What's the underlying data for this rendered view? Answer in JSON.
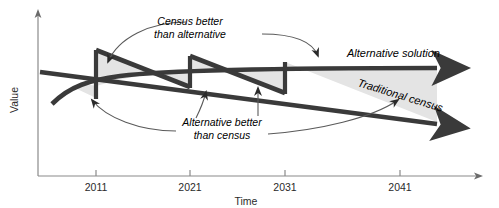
{
  "figure": {
    "type": "line-diagram",
    "axes": {
      "x_label": "Time",
      "y_label": "Value",
      "x_ticks": [
        "2011",
        "2021",
        "2031",
        "2041"
      ],
      "x_tick_positions_px": [
        96,
        190,
        285,
        400
      ],
      "x_axis_arrow": true,
      "y_axis_arrow": true,
      "grid": false
    },
    "series": [
      {
        "name": "Alternative solution",
        "label": "Alternative solution",
        "direction": "rising-then-flat",
        "arrow_end": true,
        "description": "Starts low at left, rises steeply, then levels off flat to the right with an arrowhead"
      },
      {
        "name": "Traditional census",
        "label": "Traditional census",
        "direction": "declining",
        "arrow_end": true,
        "description": "Starts high at left and declines steadily to the right ending with an arrowhead"
      }
    ],
    "annotations": [
      {
        "id": "census-better",
        "text_line_1": "Census better",
        "text_line_2": "than alternative",
        "points_to": [
          "upper-region-2011-2021",
          "upper-region-2021-2031"
        ]
      },
      {
        "id": "alternative-better",
        "text_line_1": "Alternative better",
        "text_line_2": "than census",
        "points_to": [
          "lower-region-2011-2021",
          "lower-region-2021-2031"
        ]
      }
    ],
    "shaded_regions": [
      {
        "id": "upper-region-2011-2021",
        "meaning": "census above alternative"
      },
      {
        "id": "lower-region-2011-2021",
        "meaning": "alternative above census"
      },
      {
        "id": "upper-region-2021-2031",
        "meaning": "census above alternative"
      },
      {
        "id": "region-2031-2041",
        "meaning": "alternative above census"
      }
    ],
    "colors": {
      "line": "#3a3a3a",
      "shading": "#e4e4e4",
      "axis": "#8a8a8a",
      "leader": "#5a5a5a",
      "background": "#ffffff"
    }
  }
}
